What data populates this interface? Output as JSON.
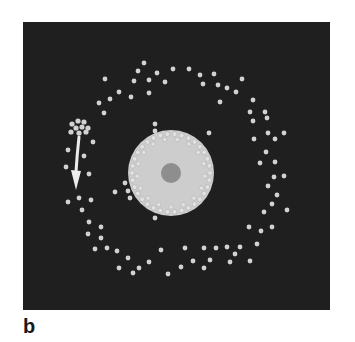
{
  "figure": {
    "panel_label": "b",
    "colors": {
      "background": "#1f1f1f",
      "dot": "#d2d2d2",
      "cell_body": "#cdcdcd",
      "cell_rim_dot": "#e2e2e2",
      "nucleus": "#8e8e8e",
      "arrow": "#ececec"
    },
    "cell": {
      "cx": 171,
      "cy": 173,
      "r": 43,
      "nucleus_r": 10,
      "rim_dot_count": 34,
      "rim_r": 39
    },
    "cluster": {
      "dots": [
        [
          72,
          124
        ],
        [
          78,
          121
        ],
        [
          84,
          122
        ],
        [
          76,
          128
        ],
        [
          82,
          127
        ],
        [
          88,
          128
        ],
        [
          71,
          132
        ],
        [
          79,
          133
        ],
        [
          86,
          132
        ]
      ]
    },
    "arrow": {
      "path": "M79,137 Q77,155 76,172",
      "head": [
        [
          71,
          170
        ],
        [
          81,
          171
        ],
        [
          76,
          190
        ]
      ]
    },
    "dots": [
      [
        105,
        79
      ],
      [
        119,
        92
      ],
      [
        110,
        99
      ],
      [
        99,
        103
      ],
      [
        104,
        113
      ],
      [
        131,
        97
      ],
      [
        138,
        71
      ],
      [
        144,
        63
      ],
      [
        134,
        81
      ],
      [
        149,
        80
      ],
      [
        157,
        73
      ],
      [
        165,
        82
      ],
      [
        173,
        69
      ],
      [
        149,
        93
      ],
      [
        189,
        69
      ],
      [
        200,
        75
      ],
      [
        214,
        74
      ],
      [
        203,
        84
      ],
      [
        218,
        85
      ],
      [
        227,
        88
      ],
      [
        236,
        92
      ],
      [
        242,
        79
      ],
      [
        220,
        102
      ],
      [
        253,
        100
      ],
      [
        250,
        112
      ],
      [
        265,
        112
      ],
      [
        253,
        121
      ],
      [
        267,
        118
      ],
      [
        268,
        133
      ],
      [
        284,
        133
      ],
      [
        254,
        139
      ],
      [
        275,
        139
      ],
      [
        266,
        152
      ],
      [
        260,
        163
      ],
      [
        275,
        162
      ],
      [
        274,
        177
      ],
      [
        284,
        176
      ],
      [
        268,
        186
      ],
      [
        277,
        195
      ],
      [
        272,
        204
      ],
      [
        287,
        210
      ],
      [
        264,
        212
      ],
      [
        272,
        227
      ],
      [
        261,
        231
      ],
      [
        249,
        227
      ],
      [
        257,
        244
      ],
      [
        240,
        247
      ],
      [
        235,
        254
      ],
      [
        230,
        262
      ],
      [
        250,
        261
      ],
      [
        227,
        247
      ],
      [
        216,
        248
      ],
      [
        204,
        248
      ],
      [
        210,
        260
      ],
      [
        204,
        268
      ],
      [
        193,
        261
      ],
      [
        185,
        248
      ],
      [
        181,
        267
      ],
      [
        168,
        274
      ],
      [
        161,
        250
      ],
      [
        149,
        262
      ],
      [
        139,
        268
      ],
      [
        133,
        273
      ],
      [
        128,
        258
      ],
      [
        119,
        268
      ],
      [
        117,
        251
      ],
      [
        107,
        248
      ],
      [
        95,
        249
      ],
      [
        89,
        222
      ],
      [
        101,
        227
      ],
      [
        88,
        234
      ],
      [
        101,
        238
      ],
      [
        82,
        210
      ],
      [
        91,
        200
      ],
      [
        79,
        198
      ],
      [
        68,
        202
      ],
      [
        89,
        174
      ],
      [
        84,
        156
      ],
      [
        66,
        167
      ],
      [
        68,
        150
      ],
      [
        93,
        142
      ],
      [
        155,
        124
      ],
      [
        155,
        131
      ],
      [
        209,
        133
      ],
      [
        125,
        183
      ],
      [
        115,
        192
      ],
      [
        128,
        191
      ],
      [
        130,
        198
      ],
      [
        155,
        218
      ]
    ]
  }
}
